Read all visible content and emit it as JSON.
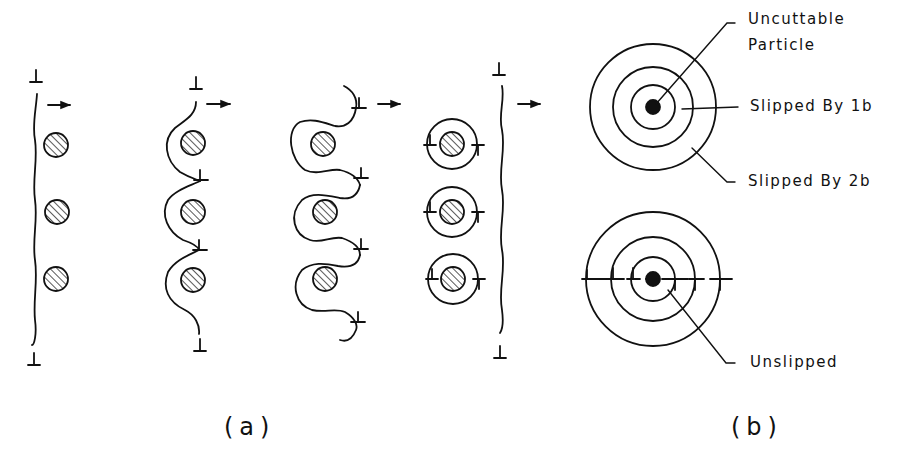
{
  "figure": {
    "panel_a": {
      "caption": "(a)",
      "stages": [
        {
          "name": "dislocation approaching particles"
        },
        {
          "name": "dislocation bowing between particles"
        },
        {
          "name": "dislocation loops wrapping particles"
        },
        {
          "name": "Orowan loops left around particles, dislocation continues"
        }
      ],
      "direction_arrow": "→",
      "particle_count_per_stage": 3
    },
    "panel_b": {
      "caption": "(b)",
      "labels": {
        "uncuttable_particle": "Uncuttable Particle",
        "uncuttable_line1": "Uncuttable",
        "uncuttable_line2": "Particle",
        "slipped_1b": "Slipped By 1b",
        "slipped_2b": "Slipped By 2b",
        "unslipped": "Unslipped"
      }
    }
  }
}
